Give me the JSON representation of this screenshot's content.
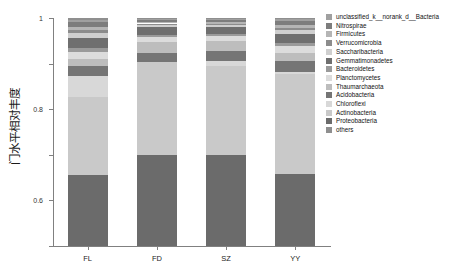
{
  "chart_data": {
    "type": "bar",
    "subtype": "stacked-bar-100pct",
    "title": "",
    "xlabel": "",
    "ylabel": "门水平相对丰度",
    "ylim": [
      0,
      1
    ],
    "yticks": [
      0,
      0.2,
      0.4,
      0.6,
      0.8,
      1
    ],
    "ytick_labels": [
      "0",
      "0.2",
      "0.4",
      "0.6",
      "0.8",
      "1"
    ],
    "grid": false,
    "legend_position": "right",
    "categories": [
      "FL",
      "FD",
      "SZ",
      "YY"
    ],
    "series": [
      {
        "name": "Proteobacteria",
        "color": "#6b6b6b",
        "values": [
          0.31,
          0.4,
          0.398,
          0.318
        ]
      },
      {
        "name": "Actinobacteria",
        "color": "#c9c9c9",
        "values": [
          0.345,
          0.405,
          0.392,
          0.435
        ]
      },
      {
        "name": "Chloroflexi",
        "color": "#d8d8d8",
        "values": [
          0.09,
          0.0,
          0.02,
          0.01
        ]
      },
      {
        "name": "Acidobacteria",
        "color": "#757575",
        "values": [
          0.045,
          0.042,
          0.046,
          0.048
        ]
      },
      {
        "name": "Thaumarchaeota",
        "color": "#bdbdbd",
        "values": [
          0.032,
          0.048,
          0.044,
          0.036
        ]
      },
      {
        "name": "Planctomycetes",
        "color": "#dcdcdc",
        "values": [
          0.03,
          0.022,
          0.02,
          0.03
        ]
      },
      {
        "name": "Bacteroidetes",
        "color": "#9a9a9a",
        "values": [
          0.018,
          0.007,
          0.008,
          0.012
        ]
      },
      {
        "name": "Gemmatimonadetes",
        "color": "#6f6f6f",
        "values": [
          0.042,
          0.035,
          0.031,
          0.04
        ]
      },
      {
        "name": "Saccharibacteria",
        "color": "#cfcfcf",
        "values": [
          0.024,
          0.012,
          0.01,
          0.02
        ]
      },
      {
        "name": "Verrucomicrobia",
        "color": "#8c8c8c",
        "values": [
          0.01,
          0.005,
          0.006,
          0.009
        ]
      },
      {
        "name": "Firmicutes",
        "color": "#b5b5b5",
        "values": [
          0.016,
          0.007,
          0.006,
          0.013
        ]
      },
      {
        "name": "Nitrospirae",
        "color": "#7d7d7d",
        "values": [
          0.02,
          0.008,
          0.009,
          0.016
        ]
      },
      {
        "name": "unclassified_k__norank_d__Bacteria",
        "color": "#a0a0a0",
        "values": [
          0.01,
          0.005,
          0.005,
          0.008
        ]
      },
      {
        "name": "others",
        "color": "#8f8f8f",
        "values": [
          0.008,
          0.004,
          0.005,
          0.005
        ]
      }
    ],
    "legend_entries": [
      {
        "label": "unclassified_k__norank_d__Bacteria",
        "color": "#a0a0a0"
      },
      {
        "label": "Nitrospirae",
        "color": "#7d7d7d"
      },
      {
        "label": "Firmicutes",
        "color": "#b5b5b5"
      },
      {
        "label": "Verrucomicrobia",
        "color": "#8c8c8c"
      },
      {
        "label": "Saccharibacteria",
        "color": "#cfcfcf"
      },
      {
        "label": "Gemmatimonadetes",
        "color": "#6f6f6f"
      },
      {
        "label": "Bacteroidetes",
        "color": "#9a9a9a"
      },
      {
        "label": "Planctomycetes",
        "color": "#dcdcdc"
      },
      {
        "label": "Thaumarchaeota",
        "color": "#bdbdbd"
      },
      {
        "label": "Acidobacteria",
        "color": "#757575"
      },
      {
        "label": "Chloroflexi",
        "color": "#d8d8d8"
      },
      {
        "label": "Actinobacteria",
        "color": "#c9c9c9"
      },
      {
        "label": "Proteobacteria",
        "color": "#6b6b6b"
      },
      {
        "label": "others",
        "color": "#8f8f8f"
      }
    ]
  }
}
